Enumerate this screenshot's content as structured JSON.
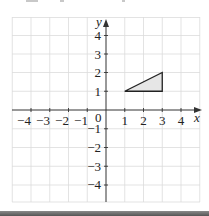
{
  "figure": {
    "x_axis_label": "x",
    "y_axis_label": "y",
    "origin_label": "0",
    "x_ticks": [
      "−4",
      "−3",
      "−2",
      "−1",
      "1",
      "2",
      "3",
      "4"
    ],
    "y_ticks": [
      "4",
      "3",
      "2",
      "1",
      "−1",
      "−2",
      "−3",
      "−4"
    ],
    "x_range": [
      -5,
      5
    ],
    "y_range": [
      -5,
      5
    ],
    "triangle": {
      "vertices": [
        [
          1,
          1
        ],
        [
          3,
          2
        ],
        [
          3,
          1
        ]
      ],
      "fill": "#e6e6e6",
      "stroke": "#222222"
    },
    "colors": {
      "grid": "#d9d9d9",
      "axis": "#333333",
      "bottom_bar": "#6b6b6b"
    }
  }
}
